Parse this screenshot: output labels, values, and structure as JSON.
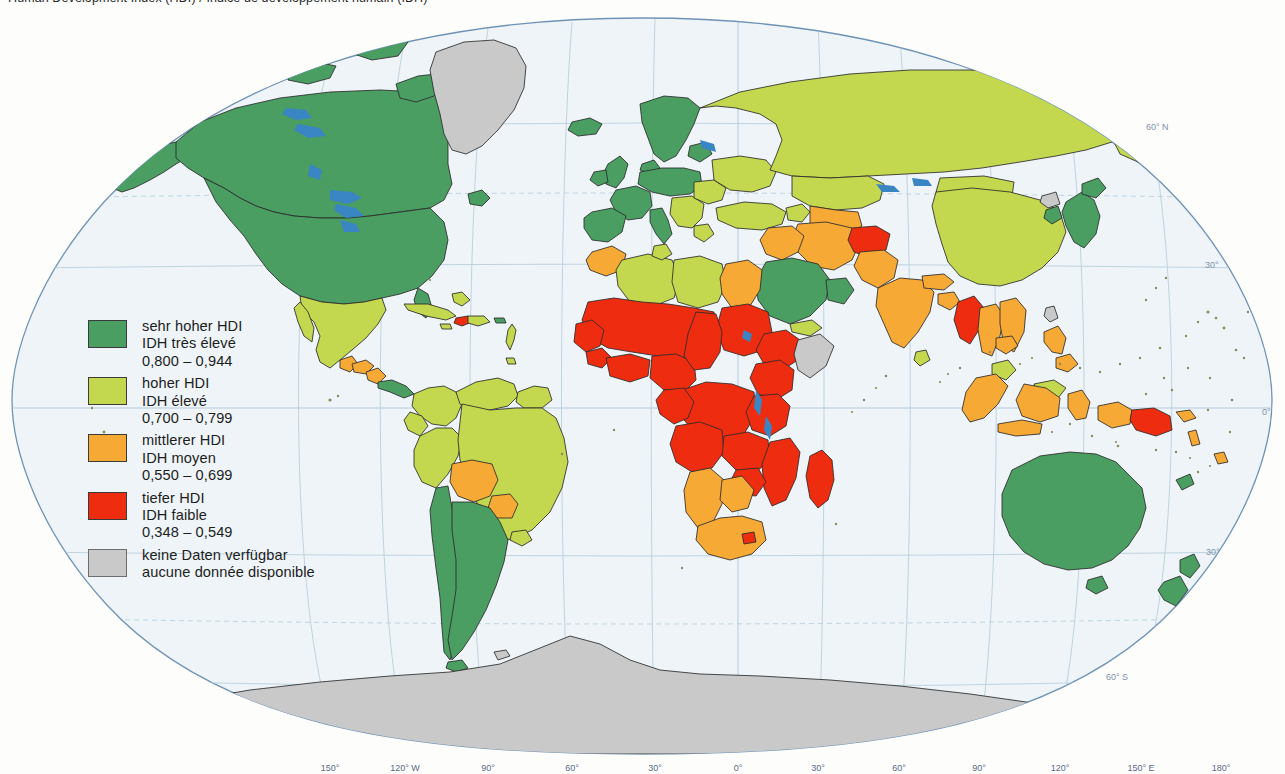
{
  "title": "Human Development Index (HDI) / Indice de développement humain (IDH)",
  "map": {
    "name": "world-hdi-choropleth",
    "projection": "Robinson",
    "ocean_color": "#eef4f8",
    "graticule_color": "#aec6da",
    "frame_color": "#6f93b5",
    "border_color": "#2b2b2b",
    "lake_color": "#3a85c4",
    "latitude_labels": [
      {
        "text": "60° N",
        "x": 1146,
        "y": 118
      },
      {
        "text": "30°",
        "x": 1205,
        "y": 256
      },
      {
        "text": "0°",
        "x": 1262,
        "y": 403
      },
      {
        "text": "30°",
        "x": 1206,
        "y": 543
      },
      {
        "text": "60° S",
        "x": 1106,
        "y": 668
      }
    ],
    "longitude_labels": [
      {
        "text": "150°",
        "x": 330
      },
      {
        "text": "120° W",
        "x": 405
      },
      {
        "text": "90°",
        "x": 488
      },
      {
        "text": "60°",
        "x": 572
      },
      {
        "text": "30°",
        "x": 655
      },
      {
        "text": "0°",
        "x": 738
      },
      {
        "text": "30°",
        "x": 818
      },
      {
        "text": "60°",
        "x": 899
      },
      {
        "text": "90°",
        "x": 979
      },
      {
        "text": "120°",
        "x": 1060
      },
      {
        "text": "150° E",
        "x": 1141
      },
      {
        "text": "180°",
        "x": 1221
      }
    ]
  },
  "legend": {
    "name": "hdi-legend",
    "items": [
      {
        "color": "#4a9e62",
        "label_de": "sehr hoher HDI",
        "label_fr": "IDH très élevé",
        "range": "0,800 – 0,944"
      },
      {
        "color": "#c3d84f",
        "label_de": "hoher HDI",
        "label_fr": "IDH élevé",
        "range": "0,700 – 0,799"
      },
      {
        "color": "#f7a936",
        "label_de": "mittlerer HDI",
        "label_fr": "IDH moyen",
        "range": "0,550 – 0,699"
      },
      {
        "color": "#ee2d10",
        "label_de": "tiefer HDI",
        "label_fr": "IDH faible",
        "range": "0,348 – 0,549"
      },
      {
        "color": "#c9c9c9",
        "label_de": "keine Daten verfügbar",
        "label_fr": "aucune donnée disponible",
        "range": ""
      }
    ]
  },
  "chart_data": {
    "type": "map",
    "title": "Human Development Index (HDI)",
    "classes": [
      {
        "name": "sehr hoher HDI / IDH très élevé",
        "min": 0.8,
        "max": 0.944,
        "color": "#4a9e62"
      },
      {
        "name": "hoher HDI / IDH élevé",
        "min": 0.7,
        "max": 0.799,
        "color": "#c3d84f"
      },
      {
        "name": "mittlerer HDI / IDH moyen",
        "min": 0.55,
        "max": 0.699,
        "color": "#f7a936"
      },
      {
        "name": "tiefer HDI / IDH faible",
        "min": 0.348,
        "max": 0.549,
        "color": "#ee2d10"
      },
      {
        "name": "keine Daten / aucune donnée",
        "min": null,
        "max": null,
        "color": "#c9c9c9"
      }
    ],
    "regions": [
      {
        "region": "Canada",
        "class": "sehr hoher HDI"
      },
      {
        "region": "United States",
        "class": "sehr hoher HDI"
      },
      {
        "region": "Greenland",
        "class": "keine Daten"
      },
      {
        "region": "Mexico",
        "class": "hoher HDI"
      },
      {
        "region": "Guatemala",
        "class": "mittlerer HDI"
      },
      {
        "region": "Honduras",
        "class": "mittlerer HDI"
      },
      {
        "region": "Nicaragua",
        "class": "mittlerer HDI"
      },
      {
        "region": "Cuba",
        "class": "hoher HDI"
      },
      {
        "region": "Haiti",
        "class": "tiefer HDI"
      },
      {
        "region": "Brazil",
        "class": "hoher HDI"
      },
      {
        "region": "Argentina",
        "class": "sehr hoher HDI"
      },
      {
        "region": "Chile",
        "class": "sehr hoher HDI"
      },
      {
        "region": "Bolivia",
        "class": "mittlerer HDI"
      },
      {
        "region": "Paraguay",
        "class": "mittlerer HDI"
      },
      {
        "region": "Peru",
        "class": "hoher HDI"
      },
      {
        "region": "Colombia",
        "class": "hoher HDI"
      },
      {
        "region": "Venezuela",
        "class": "hoher HDI"
      },
      {
        "region": "Western Europe",
        "class": "sehr hoher HDI"
      },
      {
        "region": "Russia",
        "class": "hoher HDI"
      },
      {
        "region": "China",
        "class": "hoher HDI"
      },
      {
        "region": "Mongolia",
        "class": "hoher HDI"
      },
      {
        "region": "Japan",
        "class": "sehr hoher HDI"
      },
      {
        "region": "South Korea",
        "class": "sehr hoher HDI"
      },
      {
        "region": "North Korea",
        "class": "keine Daten"
      },
      {
        "region": "India",
        "class": "mittlerer HDI"
      },
      {
        "region": "Myanmar",
        "class": "tiefer HDI"
      },
      {
        "region": "Afghanistan",
        "class": "tiefer HDI"
      },
      {
        "region": "Saudi Arabia",
        "class": "sehr hoher HDI"
      },
      {
        "region": "Algeria",
        "class": "hoher HDI"
      },
      {
        "region": "Libya",
        "class": "hoher HDI"
      },
      {
        "region": "Tunisia",
        "class": "hoher HDI"
      },
      {
        "region": "Egypt",
        "class": "mittlerer HDI"
      },
      {
        "region": "Sub-Saharan Africa",
        "class": "tiefer HDI"
      },
      {
        "region": "South Africa",
        "class": "mittlerer HDI"
      },
      {
        "region": "Namibia",
        "class": "mittlerer HDI"
      },
      {
        "region": "Botswana",
        "class": "mittlerer HDI"
      },
      {
        "region": "Madagascar",
        "class": "tiefer HDI"
      },
      {
        "region": "Somalia",
        "class": "keine Daten"
      },
      {
        "region": "Indonesia",
        "class": "mittlerer HDI"
      },
      {
        "region": "Malaysia",
        "class": "hoher HDI"
      },
      {
        "region": "Philippines",
        "class": "mittlerer HDI"
      },
      {
        "region": "Papua New Guinea",
        "class": "tiefer HDI"
      },
      {
        "region": "Australia",
        "class": "sehr hoher HDI"
      },
      {
        "region": "New Zealand",
        "class": "sehr hoher HDI"
      },
      {
        "region": "Antarctica",
        "class": "keine Daten"
      }
    ]
  }
}
